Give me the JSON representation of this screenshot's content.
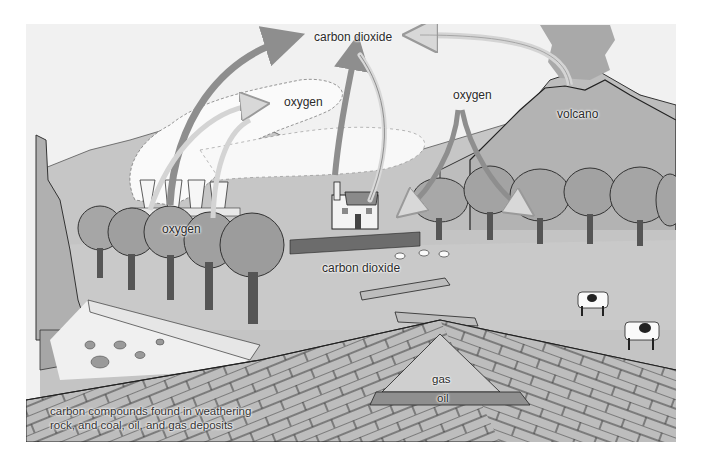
{
  "diagram": {
    "labels": {
      "carbon_dioxide_top": "carbon dioxide",
      "oxygen_sky": "oxygen",
      "oxygen_right": "oxygen",
      "volcano": "volcano",
      "oxygen_trees": "oxygen",
      "carbon_dioxide_ground": "carbon dioxide",
      "gas": "gas",
      "oil": "oil",
      "caption_line1": "carbon compounds found in weathering",
      "caption_line2": "rock, and coal, oil, and gas deposits"
    },
    "elements": [
      "power-station-cooling-towers",
      "cottage-with-chimney",
      "volcano",
      "trees",
      "sheep",
      "cows",
      "fallen-logs",
      "rock-cliff",
      "rock-strata",
      "gas-deposit",
      "oil-deposit"
    ],
    "arrows": [
      {
        "from": "trees",
        "to": "carbon dioxide (top)",
        "meaning": "respiration"
      },
      {
        "from": "cottage",
        "to": "carbon dioxide (top)",
        "meaning": "combustion"
      },
      {
        "from": "volcano",
        "to": "carbon dioxide (top)",
        "meaning": "volcanic emission"
      },
      {
        "from": "carbon dioxide (top)",
        "to": "power station area",
        "meaning": "uptake"
      },
      {
        "from": "power station",
        "to": "oxygen (sky)",
        "meaning": "oxygen release"
      },
      {
        "from": "oxygen (right)",
        "to": "forest",
        "meaning": "oxygen uptake"
      }
    ],
    "colors": {
      "sky": "#f2f2f2",
      "ground": "#c4c4c4",
      "hills": "#b5b5b5",
      "trees": "#a4a4a4",
      "arrow_dark": "#8e8e8e",
      "arrow_light": "#d6d6d6",
      "strata": "#b8b8b8",
      "oil": "#8f8f8f",
      "gas": "#cfcfcf"
    }
  }
}
